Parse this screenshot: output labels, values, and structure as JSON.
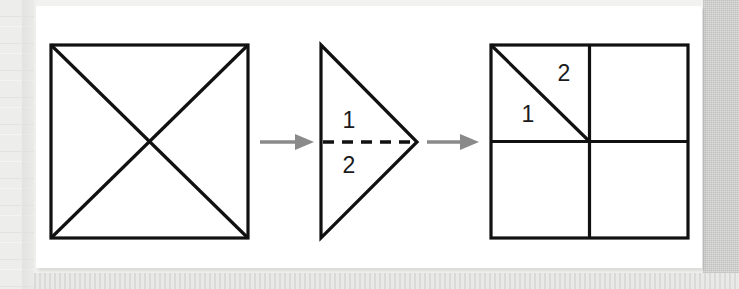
{
  "figure": {
    "background_color": "#ffffff",
    "page_background_color": "#f2f2f0",
    "stroke_color": "#111111",
    "arrow_color": "#8a8a8a",
    "steps": [
      {
        "index": 1,
        "name": "square-with-diagonals",
        "description": "Square with both diagonals drawn forming an X",
        "labels": []
      },
      {
        "index": 2,
        "name": "folded-triangle",
        "description": "Right-pointing triangle with a horizontal dashed fold line splitting it into region 1 on top and region 2 on the bottom",
        "labels": [
          {
            "text": "1",
            "position": "above-dashed-fold-line"
          },
          {
            "text": "2",
            "position": "below-dashed-fold-line"
          }
        ]
      },
      {
        "index": 3,
        "name": "unfolded-quadrants",
        "description": "Square divided into four quadrants by a vertical and a horizontal line, with a diagonal across the top-left quadrant",
        "labels": [
          {
            "text": "2",
            "position": "upper-right-of-diagonal"
          },
          {
            "text": "1",
            "position": "lower-left-of-diagonal"
          }
        ]
      }
    ],
    "arrows": [
      {
        "index": 1,
        "name": "arrow-step1-to-step2",
        "direction": "right"
      },
      {
        "index": 2,
        "name": "arrow-step2-to-step3",
        "direction": "right"
      }
    ],
    "shape1": {
      "x": 15,
      "y": 39,
      "width": 197,
      "height": 193
    },
    "shape2": {
      "apex_x": 381,
      "top_y": 39,
      "bottom_y": 232,
      "left_x": 285,
      "fold_label_top": "1",
      "fold_label_bottom": "2"
    },
    "shape3": {
      "x": 455,
      "y": 39,
      "width": 197,
      "height": 193,
      "label_upper": "2",
      "label_lower": "1"
    }
  }
}
